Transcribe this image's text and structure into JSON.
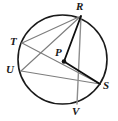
{
  "figure": {
    "type": "circle-geometry-diagram",
    "width": 118,
    "height": 121,
    "background_color": "#ffffff"
  },
  "circle": {
    "name": "circle-P",
    "center_label": "P",
    "center_x": 62.5,
    "center_y": 59.5,
    "radius": 44.5,
    "stroke_color": "#1a1a1a",
    "stroke_width": 1.6
  },
  "center_point": {
    "label": "P",
    "x": 64,
    "y": 61.5,
    "dot_radius": 2.3,
    "dot_color": "#111111",
    "label_x": 55,
    "label_y": 47
  },
  "points": [
    {
      "label": "R",
      "x": 81,
      "y": 16,
      "label_x": 76,
      "label_y": 1
    },
    {
      "label": "T",
      "x": 22,
      "y": 43,
      "label_x": 10,
      "label_y": 36
    },
    {
      "label": "U",
      "x": 21,
      "y": 71,
      "label_x": 6,
      "label_y": 64
    },
    {
      "label": "S",
      "x": 100,
      "y": 84,
      "label_x": 103,
      "label_y": 80
    },
    {
      "label": "V",
      "x": 77,
      "y": 104,
      "label_x": 72,
      "label_y": 106
    }
  ],
  "chords": [
    {
      "name": "chord-T-R",
      "from": "T",
      "to": "R",
      "x1": 22,
      "y1": 43,
      "x2": 81,
      "y2": 16,
      "color": "#7d7d7d",
      "width": 1.1
    },
    {
      "name": "chord-U-R",
      "from": "U",
      "to": "R",
      "x1": 21,
      "y1": 71,
      "x2": 81,
      "y2": 16,
      "color": "#7d7d7d",
      "width": 1.1
    },
    {
      "name": "chord-T-S",
      "from": "T",
      "to": "S",
      "x1": 22,
      "y1": 43,
      "x2": 100,
      "y2": 84,
      "color": "#7d7d7d",
      "width": 1.1
    },
    {
      "name": "chord-U-S",
      "from": "U",
      "to": "S",
      "x1": 21,
      "y1": 71,
      "x2": 100,
      "y2": 84,
      "color": "#7d7d7d",
      "width": 1.1
    },
    {
      "name": "chord-R-V",
      "from": "R",
      "to": "V",
      "x1": 81,
      "y1": 16,
      "x2": 77,
      "y2": 104,
      "color": "#8d8d8d",
      "width": 1.4
    }
  ],
  "radii": [
    {
      "name": "radius-P-R",
      "from": "P",
      "to": "R",
      "x1": 64,
      "y1": 61.5,
      "x2": 81,
      "y2": 16,
      "color": "#0d0d0d",
      "width": 1.8
    },
    {
      "name": "radius-P-S",
      "from": "P",
      "to": "S",
      "x1": 64,
      "y1": 61.5,
      "x2": 100,
      "y2": 84,
      "color": "#0d0d0d",
      "width": 1.8
    }
  ]
}
